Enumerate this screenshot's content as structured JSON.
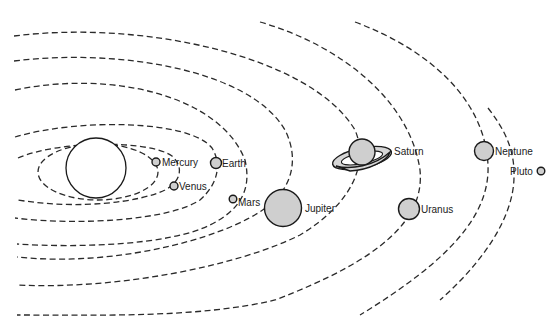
{
  "diagram": {
    "sun": {
      "label": ""
    },
    "planets": [
      {
        "name": "Mercury",
        "label": "Mercury"
      },
      {
        "name": "Venus",
        "label": "Venus"
      },
      {
        "name": "Earth",
        "label": "Earth"
      },
      {
        "name": "Mars",
        "label": "Mars"
      },
      {
        "name": "Jupiter",
        "label": "Jupiter"
      },
      {
        "name": "Saturn",
        "label": "Saturn"
      },
      {
        "name": "Uranus",
        "label": "Uranus"
      },
      {
        "name": "Neptune",
        "label": "Neptune"
      },
      {
        "name": "Pluto",
        "label": "Pluto"
      }
    ],
    "colors": {
      "stroke": "#1a1a1a",
      "planet_fill": "#cfcfcf",
      "background": "#ffffff"
    }
  }
}
